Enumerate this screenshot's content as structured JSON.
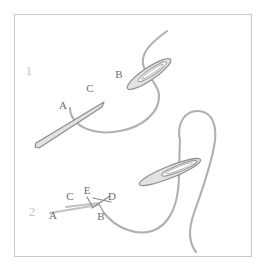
{
  "figure": {
    "background_color": "#ffffff",
    "frame_color": "#c9c9c9",
    "thread_color": "#b0b0b0",
    "needle_fill": "#e2e2e2",
    "needle_stroke": "#8d8d8d",
    "label_color": "#6e6e6e",
    "step_number_color": "#c4c4c4"
  },
  "steps": [
    {
      "number": "1",
      "labels": [
        {
          "id": "label-1-a",
          "text": "A",
          "x": 63,
          "y": 109
        },
        {
          "id": "label-1-c",
          "text": "C",
          "x": 90,
          "y": 92
        },
        {
          "id": "label-1-b",
          "text": "B",
          "x": 119,
          "y": 78
        }
      ]
    },
    {
      "number": "2",
      "labels": [
        {
          "id": "label-2-a",
          "text": "A",
          "x": 53,
          "y": 219
        },
        {
          "id": "label-2-c",
          "text": "C",
          "x": 70,
          "y": 200
        },
        {
          "id": "label-2-e",
          "text": "E",
          "x": 87,
          "y": 194
        },
        {
          "id": "label-2-d",
          "text": "D",
          "x": 110,
          "y": 200
        },
        {
          "id": "label-2-b",
          "text": "B",
          "x": 101,
          "y": 219
        }
      ]
    }
  ],
  "step_numbers": [
    {
      "text": "1",
      "x": 29,
      "y": 75
    },
    {
      "text": "2",
      "x": 32,
      "y": 216
    }
  ]
}
